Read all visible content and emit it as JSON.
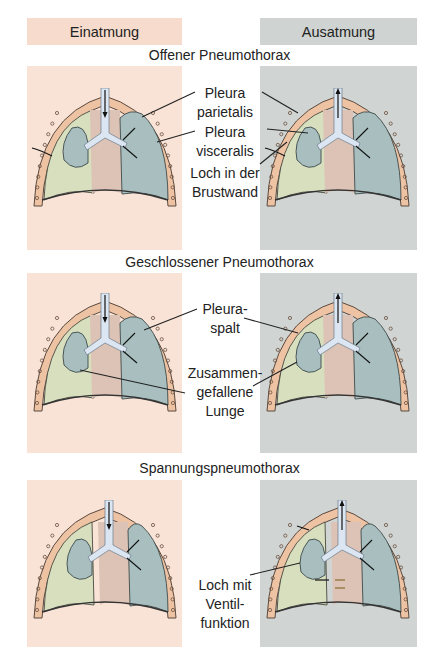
{
  "headers": {
    "inhale": "Einatmung",
    "exhale": "Ausatmung"
  },
  "sections": [
    {
      "title": "Offener Pneumothorax",
      "labels": [
        {
          "line1": "Pleura",
          "line2": "parietalis"
        },
        {
          "line1": "Pleura",
          "line2": "visceralis"
        },
        {
          "line1": "Loch in der",
          "line2": "Brustwand"
        }
      ]
    },
    {
      "title": "Geschlossener Pneumothorax",
      "labels": [
        {
          "line1": "Pleura-",
          "line2": "spalt"
        },
        {
          "line1": "Zusammen-",
          "line2": "gefallene",
          "line3": "Lunge"
        }
      ]
    },
    {
      "title": "Spannungspneumothorax",
      "labels": [
        {
          "line1": "Loch mit",
          "line2": "Ventil-",
          "line3": "funktion"
        }
      ]
    }
  ],
  "colors": {
    "inhale_bg": "#f8e3d6",
    "exhale_bg": "#d0d4d2",
    "chest_wall": "#eec3a4",
    "lung_green": "#d7dfbf",
    "lung_blue": "#a9bfbf",
    "mediastinum": "#dcc3b5",
    "trachea": "#dbe6f2"
  }
}
